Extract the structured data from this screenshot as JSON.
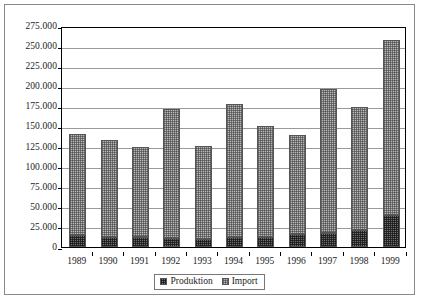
{
  "chart_data": {
    "type": "bar",
    "title": "",
    "subtitle": "",
    "xlabel": "",
    "ylabel": "",
    "stacked": true,
    "grid": true,
    "legend_position": "bottom",
    "ylim": [
      0,
      275000
    ],
    "ytick_step": 25000,
    "categories": [
      "1989",
      "1990",
      "1991",
      "1992",
      "1993",
      "1994",
      "1995",
      "1996",
      "1997",
      "1998",
      "1999"
    ],
    "ytick_labels": [
      "275.000",
      "250.000",
      "225.000",
      "200.000",
      "175.000",
      "150.000",
      "125.000",
      "100.000",
      "75.000",
      "50.000",
      "25.000",
      "0"
    ],
    "ytick_values": [
      275000,
      250000,
      225000,
      200000,
      175000,
      150000,
      125000,
      100000,
      75000,
      50000,
      25000,
      0
    ],
    "series": [
      {
        "name": "Produktion",
        "color": "#6e6e6e",
        "values": [
          15000,
          13000,
          13000,
          11000,
          10000,
          12000,
          13000,
          16000,
          18000,
          21000,
          40000
        ]
      },
      {
        "name": "Import",
        "color": "#b9b9b9",
        "values": [
          126000,
          120000,
          112000,
          161000,
          116000,
          166000,
          138000,
          123000,
          179000,
          153000,
          218000
        ]
      }
    ],
    "totals": [
      141000,
      133000,
      125000,
      172000,
      126000,
      178000,
      151000,
      139000,
      197000,
      174000,
      258000
    ]
  },
  "legend": {
    "items": [
      {
        "label": "Produktion",
        "swatch": "produktion-swatch"
      },
      {
        "label": "Import",
        "swatch": "import-swatch"
      }
    ]
  }
}
